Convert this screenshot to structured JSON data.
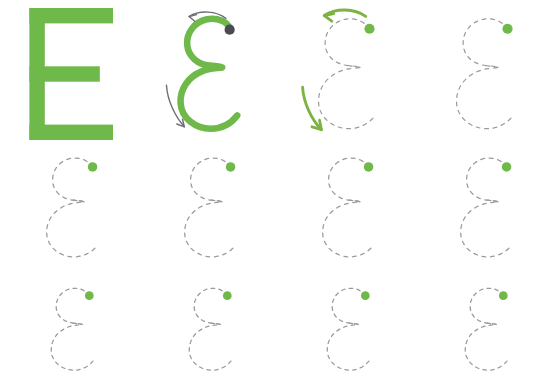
{
  "worksheet": {
    "title": "Letter E Tracing Practice",
    "letter": "E",
    "letter_lowercase_form": "ɛ",
    "background_color": "#ffffff",
    "width": 556,
    "height": 379
  },
  "colors": {
    "letter_green": "#6FB94B",
    "arrow_green": "#7CB342",
    "dash_gray": "#9A9A9A",
    "start_dot_dark": "#4A4A52",
    "start_dot_green": "#6FB94B",
    "arrow_gray": "#6E6E76"
  },
  "style": {
    "dash_pattern": "4 5",
    "dash_width": 1.3,
    "stroke_width_model": 7,
    "dot_radius": 4.6
  },
  "rows": [
    {
      "row_index": 1,
      "row_name": "demonstration-row",
      "top": 8,
      "glyph_height": 124,
      "scale": 1.0,
      "cells": [
        {
          "cell_index": 1,
          "name": "model-letter-solid",
          "left": 14,
          "kind": "solid-capital-e",
          "has_dot": false,
          "dot_color": "",
          "arrows": []
        },
        {
          "cell_index": 2,
          "name": "model-letter-stroke",
          "left": 152,
          "kind": "solid-epsilon",
          "has_dot": true,
          "dot_color": "#4A4A52",
          "arrows": [
            "top-gray",
            "bottom-gray"
          ]
        },
        {
          "cell_index": 3,
          "name": "trace-guide-with-arrows",
          "left": 290,
          "kind": "dashed-epsilon",
          "has_dot": true,
          "dot_color": "#6FB94B",
          "arrows": [
            "top-green",
            "bottom-green"
          ]
        },
        {
          "cell_index": 4,
          "name": "trace-guide-plain",
          "left": 428,
          "kind": "dashed-epsilon",
          "has_dot": true,
          "dot_color": "#6FB94B",
          "arrows": []
        }
      ]
    },
    {
      "row_index": 2,
      "row_name": "practice-row-medium",
      "top": 148,
      "glyph_height": 104,
      "scale": 0.84,
      "cells": [
        {
          "cell_index": 1,
          "name": "practice-glyph",
          "left": 24,
          "kind": "dashed-epsilon",
          "has_dot": true,
          "dot_color": "#6FB94B",
          "arrows": []
        },
        {
          "cell_index": 2,
          "name": "practice-glyph",
          "left": 162,
          "kind": "dashed-epsilon",
          "has_dot": true,
          "dot_color": "#6FB94B",
          "arrows": []
        },
        {
          "cell_index": 3,
          "name": "practice-glyph",
          "left": 300,
          "kind": "dashed-epsilon",
          "has_dot": true,
          "dot_color": "#6FB94B",
          "arrows": []
        },
        {
          "cell_index": 4,
          "name": "practice-glyph",
          "left": 438,
          "kind": "dashed-epsilon",
          "has_dot": true,
          "dot_color": "#6FB94B",
          "arrows": []
        }
      ]
    },
    {
      "row_index": 3,
      "row_name": "practice-row-small",
      "top": 282,
      "glyph_height": 82,
      "scale": 0.66,
      "cells": [
        {
          "cell_index": 1,
          "name": "practice-glyph",
          "left": 34,
          "kind": "dashed-epsilon",
          "has_dot": true,
          "dot_color": "#6FB94B",
          "arrows": []
        },
        {
          "cell_index": 2,
          "name": "practice-glyph",
          "left": 172,
          "kind": "dashed-epsilon",
          "has_dot": true,
          "dot_color": "#6FB94B",
          "arrows": []
        },
        {
          "cell_index": 3,
          "name": "practice-glyph",
          "left": 310,
          "kind": "dashed-epsilon",
          "has_dot": true,
          "dot_color": "#6FB94B",
          "arrows": []
        },
        {
          "cell_index": 4,
          "name": "practice-glyph",
          "left": 448,
          "kind": "dashed-epsilon",
          "has_dot": true,
          "dot_color": "#6FB94B",
          "arrows": []
        }
      ]
    }
  ],
  "geometry": {
    "capital_e": {
      "viewbox": "0 0 80 120",
      "stem_x": 4,
      "stem_width": 14,
      "top_bar_width": 76,
      "mid_bar_width": 64,
      "bottom_bar_width": 76,
      "bar_height": 14,
      "mid_bar_y": 53
    },
    "epsilon_path": "M 62 14 C 62 4 48 0 38 2 C 24 5 16 17 17 29 C 18 42 29 50 41 51 C 47 51.5 52 52 54 53 C 48 54 40 54 33 57 C 18 63 9 76 10 91 C 11 107 26 118 42 118 C 54 118 64 112 70 104",
    "epsilon_viewbox": "0 0 80 124"
  },
  "labels": {
    "letter_name": "E",
    "glyph_name": "epsilon",
    "instruction_hidden": "Trace the letter E"
  }
}
